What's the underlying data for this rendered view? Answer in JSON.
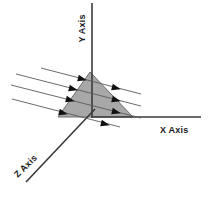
{
  "figure": {
    "type": "3d-axes-diagram",
    "background_color": "#ffffff",
    "stroke_color": "#3a3a3a",
    "shape_fill_color": "#a8a8a8",
    "shape_stroke_color": "#6f6f6f",
    "arrow_color": "#111111",
    "labels": {
      "y_axis": "Y Axis",
      "x_axis": "X Axis",
      "z_axis": "Z Axis"
    },
    "axes": [
      {
        "name": "y-axis",
        "label": "Y Axis",
        "from": [
          92,
          3
        ],
        "to": [
          92,
          118
        ]
      },
      {
        "name": "x-axis",
        "label": "X Axis",
        "from": [
          92,
          117
        ],
        "to": [
          201,
          117
        ]
      },
      {
        "name": "z-axis",
        "label": "Z Axis",
        "from": [
          95,
          109
        ],
        "to": [
          26,
          182
        ]
      }
    ],
    "shaded_shape": {
      "name": "triangle-surface",
      "points": "90,72 133,117 58,117"
    },
    "flow_lines": [
      {
        "name": "flow-line-1",
        "from": [
          41,
          68
        ],
        "to": [
          141,
          94
        ],
        "arrows": [
          [
            78,
            78
          ],
          [
            110,
            86
          ]
        ]
      },
      {
        "name": "flow-line-2",
        "from": [
          16,
          74
        ],
        "to": [
          141,
          106
        ],
        "arrows": [
          [
            69,
            88
          ],
          [
            110,
            99
          ]
        ]
      },
      {
        "name": "flow-line-3",
        "from": [
          11,
          85
        ],
        "to": [
          141,
          118
        ],
        "arrows": [
          [
            66,
            99
          ],
          [
            110,
            110
          ]
        ]
      },
      {
        "name": "flow-line-4",
        "from": [
          12,
          99
        ],
        "to": [
          120,
          127
        ],
        "arrows": [
          [
            62,
            112
          ],
          [
            104,
            123
          ]
        ]
      }
    ],
    "arrow_count": 8,
    "flow_line_count": 4
  }
}
